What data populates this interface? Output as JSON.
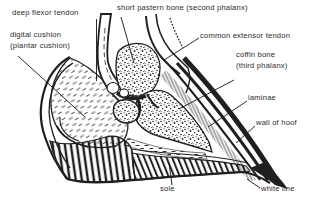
{
  "figure": {
    "type": "anatomical line diagram",
    "colors": {
      "ink": "#1f1f1f",
      "background": "#ffffff"
    },
    "labels": {
      "deep_flexor_tendon": "deep flexor tendon",
      "digital_cushion_line1": "digital cushion",
      "digital_cushion_line2": "(plantar cushion)",
      "short_pastern_bone": "short pastern bone (second phalanx)",
      "common_extensor_tendon": "common extensor tendon",
      "coffin_bone_line1": "coffin bone",
      "coffin_bone_line2": "(third phalanx)",
      "laminae": "laminae",
      "wall_of_hoof": "wall of hoof",
      "sole": "sole",
      "white_line": "white line"
    }
  }
}
